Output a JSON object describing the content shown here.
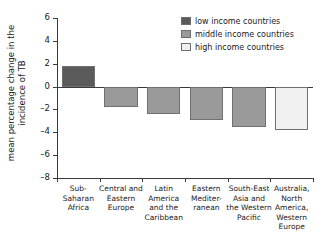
{
  "chart_data": {
    "type": "bar",
    "title": "",
    "xlabel": "",
    "ylabel_line1": "mean percentage change in the",
    "ylabel_line2": "incidence of TB",
    "ylim": [
      -8,
      6
    ],
    "yticks": [
      6,
      4,
      2,
      0,
      -2,
      -4,
      -6,
      -8
    ],
    "ytick_labels": [
      "6",
      "4",
      "2",
      "0",
      "–2",
      "–4",
      "–6",
      "–8"
    ],
    "grid": false,
    "zero_line": true,
    "categories": [
      "Sub-Saharan Africa",
      "Central and Eastern Europe",
      "Latin America and the Caribbean",
      "Eastern Mediterranean",
      "South-East Asia and the Western Pacific",
      "Australia, North America, Western Europe"
    ],
    "category_labels": [
      "Sub-\nSaharan\nAfrica",
      "Central and\nEastern\nEurope",
      "Latin\nAmerica\nand the\nCaribbean",
      "Eastern\nMediter-\nranean",
      "South-East\nAsia and\nthe Western\nPacific",
      "Australia,\nNorth\nAmerica,\nWestern\nEurope"
    ],
    "values": [
      1.8,
      -1.8,
      -2.4,
      -2.9,
      -3.5,
      -3.8
    ],
    "bar_groups": [
      "low",
      "middle",
      "middle",
      "middle",
      "middle",
      "high"
    ],
    "colors": {
      "low": "#5a5a5a",
      "middle": "#9a9a9a",
      "high": "#f0f0f0",
      "bar_border": "#707070",
      "axis": "#3a3a3a",
      "text": "#1a1a1a",
      "background": "#ffffff"
    },
    "legend_position": "top-right",
    "legend": [
      {
        "label": "low income countries",
        "group": "low"
      },
      {
        "label": "middle income countries",
        "group": "middle"
      },
      {
        "label": "high income countries",
        "group": "high"
      }
    ]
  }
}
